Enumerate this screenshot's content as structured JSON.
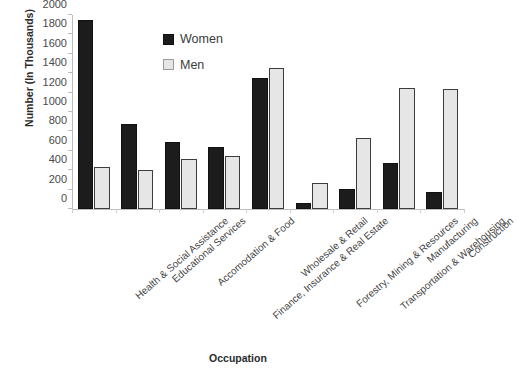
{
  "chart_data": {
    "type": "bar",
    "title": "",
    "xlabel": "Occupation",
    "ylabel": "Number (In Thousands)",
    "ylim": [
      0,
      2000
    ],
    "yticks": [
      0,
      200,
      400,
      600,
      800,
      1000,
      1200,
      1400,
      1600,
      1800,
      2000
    ],
    "grid": false,
    "legend_position": "upper-center",
    "categories": [
      "Health & Social Assistance",
      "Educational Services",
      "Accomodation & Food",
      "Finance, Insurance & Real Estate",
      "Wholesale & Retail",
      "Forestry, Mining & Resources",
      "Transportation & Warehousing",
      "Manufacturing",
      "Construction"
    ],
    "series": [
      {
        "name": "Women",
        "color": "#1c1c1c",
        "values": [
          1950,
          880,
          690,
          640,
          1350,
          60,
          210,
          470,
          175
        ]
      },
      {
        "name": "Men",
        "color": "#e6e6e6",
        "values": [
          430,
          405,
          515,
          545,
          1455,
          270,
          730,
          1250,
          1235
        ]
      }
    ]
  },
  "axes": {
    "y_title": "Number (In Thousands)",
    "x_title": "Occupation"
  },
  "legend": {
    "items": [
      {
        "label": "Women",
        "swatch": "women"
      },
      {
        "label": "Men",
        "swatch": "men"
      }
    ]
  }
}
